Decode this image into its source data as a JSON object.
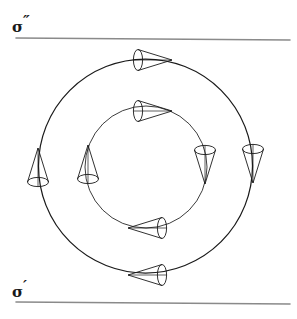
{
  "figure": {
    "width": 297,
    "height": 319,
    "background_color": "#ffffff",
    "stroke_color": "#1a1a1a",
    "rule_color": "#8a8a8a"
  },
  "labels": {
    "top": {
      "symbol": "σ",
      "prime": "″",
      "full": "σ″",
      "name": "sigma-double-prime"
    },
    "bottom": {
      "symbol": "σ",
      "prime": "′",
      "full": "σ′",
      "name": "sigma-prime"
    }
  },
  "rules": [
    {
      "id": "top-rule",
      "x1": 16,
      "y1": 38,
      "x2": 290,
      "y2": 40
    },
    {
      "id": "bottom-rule",
      "x1": 16,
      "y1": 302,
      "x2": 290,
      "y2": 304
    }
  ],
  "circles": [
    {
      "id": "outer-circle",
      "cx": 145.5,
      "cy": 166,
      "r": 107
    },
    {
      "id": "inner-circle",
      "cx": 146,
      "cy": 167,
      "r": 61
    }
  ],
  "cones": [
    {
      "id": "outer-cone-top",
      "ring": "outer",
      "position": "top",
      "direction": "left",
      "cx": 152,
      "cy": 60,
      "angle": 180
    },
    {
      "id": "outer-cone-right",
      "ring": "outer",
      "position": "right",
      "direction": "up",
      "cx": 253,
      "cy": 163,
      "angle": 270
    },
    {
      "id": "outer-cone-bottom",
      "ring": "outer",
      "position": "bottom",
      "direction": "right",
      "cx": 148,
      "cy": 275,
      "angle": 0
    },
    {
      "id": "outer-cone-left",
      "ring": "outer",
      "position": "left",
      "direction": "down",
      "cx": 38,
      "cy": 168,
      "angle": 90
    },
    {
      "id": "inner-cone-top",
      "ring": "inner",
      "position": "top",
      "direction": "left",
      "cx": 152,
      "cy": 111,
      "angle": 180
    },
    {
      "id": "inner-cone-right",
      "ring": "inner",
      "position": "right",
      "direction": "up",
      "cx": 205,
      "cy": 164,
      "angle": 270
    },
    {
      "id": "inner-cone-bottom",
      "ring": "inner",
      "position": "bottom",
      "direction": "right",
      "cx": 148,
      "cy": 228,
      "angle": 0
    },
    {
      "id": "inner-cone-left",
      "ring": "inner",
      "position": "left",
      "direction": "down",
      "cx": 88,
      "cy": 165,
      "angle": 90
    }
  ]
}
